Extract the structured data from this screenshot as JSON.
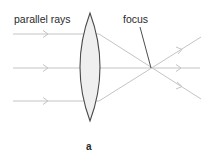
{
  "diagram": {
    "type": "converging-lens-ray-diagram",
    "labels": {
      "parallel_rays": "parallel rays",
      "focus": "focus",
      "caption": "a"
    },
    "colors": {
      "ray": "#c4c4c4",
      "lens_outline": "#4a4a4a",
      "lens_fill": "#efefef",
      "pointer": "#3a3a3a",
      "text": "#2a2a2a"
    },
    "lens": {
      "center_x": 90,
      "top_y": 13,
      "bottom_y": 121,
      "half_width": 13
    },
    "focus_point": {
      "x": 151,
      "y": 68
    },
    "rays": [
      {
        "name": "top",
        "y": 34
      },
      {
        "name": "middle",
        "y": 68
      },
      {
        "name": "bottom",
        "y": 101
      }
    ]
  }
}
